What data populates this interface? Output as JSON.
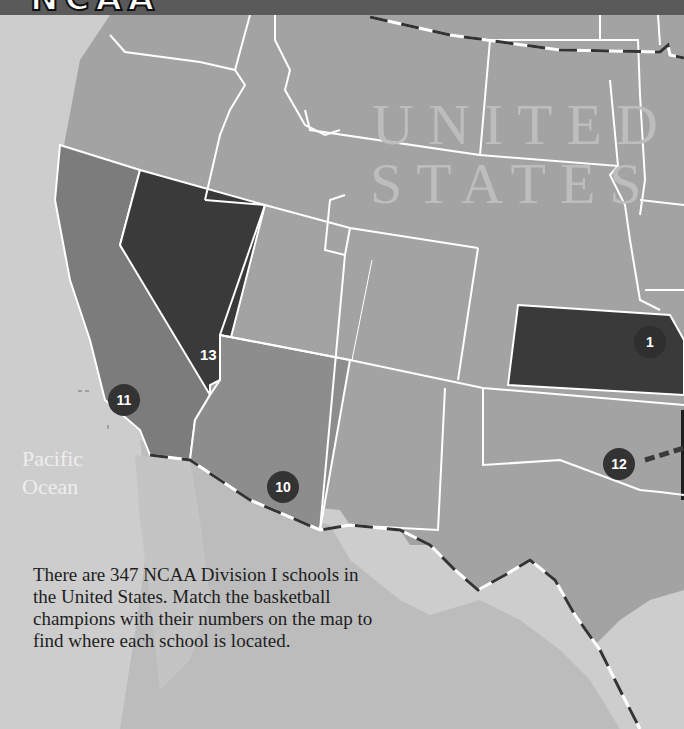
{
  "header": {
    "title_fragment": "NCAA",
    "title_partial_note": "cut-off title banner"
  },
  "labels": {
    "country_us_line1": "UNITED",
    "country_us_line2": "STATES",
    "country_mexico": "MEXICO",
    "ocean_line1": "Pacific",
    "ocean_line2": "Ocean"
  },
  "markers": [
    {
      "number": "1",
      "state": "Kansas"
    },
    {
      "number": "10",
      "state": "Arizona"
    },
    {
      "number": "11",
      "state": "California"
    },
    {
      "number": "12",
      "state": "Oklahoma / Arkansas (leader line)"
    },
    {
      "number": "13",
      "state": "Nevada"
    }
  ],
  "caption": {
    "text": "There are 347 NCAA Division I schools in the United States. Match the basketball champions with their numbers on the map to find where each school is located."
  },
  "colors": {
    "highlight_state": "#3a3a3a",
    "california": "#7c7c7c",
    "arizona": "#8d8d8d",
    "other_states": "#a3a3a3",
    "ocean": "#cfcfcf",
    "mexico": "#bdbdbd",
    "border": "#ffffff"
  }
}
